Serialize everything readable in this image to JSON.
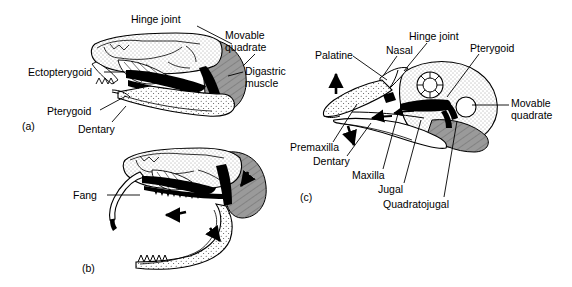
{
  "figure": {
    "background_color": "#ffffff",
    "ink_color": "#000000",
    "muscle_fill": "#9a9a9a",
    "bone_stipple": "#ffffff",
    "width": 572,
    "height": 287
  },
  "panels": [
    {
      "id": "panel-a",
      "label": "(a)",
      "subject": "snake skull, mouth closed",
      "label_x": 22,
      "label_y": 120,
      "annotations": [
        {
          "name": "hinge-joint",
          "text": "Hinge joint",
          "x": 131,
          "y": 14,
          "align": "left",
          "leader": [
            [
              197,
              26
            ],
            [
              232,
              44
            ]
          ]
        },
        {
          "name": "movable-quadrate",
          "text": "Movable\nquadrate",
          "x": 225,
          "y": 30,
          "align": "left",
          "leader": [
            [
              255,
              54
            ],
            [
              243,
              66
            ]
          ]
        },
        {
          "name": "digastric-muscle",
          "text": "Digastric\nmuscle",
          "x": 245,
          "y": 66,
          "align": "left",
          "leader": [
            [
              243,
              72
            ],
            [
              228,
              76
            ]
          ]
        },
        {
          "name": "ectopterygoid",
          "text": "Ectopterygoid",
          "x": 28,
          "y": 67,
          "align": "left",
          "leader": [
            [
              104,
              72
            ],
            [
              150,
              72
            ]
          ]
        },
        {
          "name": "pterygoid",
          "text": "Pterygoid",
          "x": 47,
          "y": 106,
          "align": "left",
          "leader": [
            [
              100,
              110
            ],
            [
              126,
              96
            ]
          ]
        },
        {
          "name": "dentary",
          "text": "Dentary",
          "x": 78,
          "y": 124,
          "align": "left",
          "leader": [
            [
              112,
              122
            ],
            [
              126,
              106
            ]
          ]
        }
      ]
    },
    {
      "id": "panel-b",
      "label": "(b)",
      "subject": "snake skull, mouth open, fang erected",
      "label_x": 82,
      "label_y": 262,
      "annotations": [
        {
          "name": "fang",
          "text": "Fang",
          "x": 73,
          "y": 190,
          "align": "left",
          "leader": [
            [
              107,
              195
            ],
            [
              140,
              195
            ]
          ]
        }
      ]
    },
    {
      "id": "panel-c",
      "label": "(c)",
      "subject": "bird skull, cranial kinesis",
      "label_x": 300,
      "label_y": 191,
      "annotations": [
        {
          "name": "hinge-joint",
          "text": "Hinge joint",
          "x": 409,
          "y": 31,
          "align": "left",
          "leader": [
            [
              427,
              43
            ],
            [
              404,
              71
            ]
          ]
        },
        {
          "name": "nasal",
          "text": "Nasal",
          "x": 386,
          "y": 45,
          "align": "left",
          "leader": [
            [
              397,
              56
            ],
            [
              383,
              76
            ]
          ]
        },
        {
          "name": "pterygoid",
          "text": "Pterygoid",
          "x": 470,
          "y": 43,
          "align": "left",
          "leader": [
            [
              479,
              54
            ],
            [
              447,
              97
            ]
          ]
        },
        {
          "name": "palatine",
          "text": "Palatine",
          "x": 315,
          "y": 50,
          "align": "left",
          "leader": [
            [
              353,
              56
            ],
            [
              387,
              80
            ]
          ]
        },
        {
          "name": "movable-quadrate",
          "text": "Movable\nquadrate",
          "x": 511,
          "y": 98,
          "align": "left",
          "leader": [
            [
              509,
              105
            ],
            [
              472,
              105
            ]
          ]
        },
        {
          "name": "premaxilla",
          "text": "Premaxilla",
          "x": 290,
          "y": 142,
          "align": "left",
          "leader": [
            [
              333,
              142
            ],
            [
              357,
              104
            ]
          ]
        },
        {
          "name": "dentary",
          "text": "Dentary",
          "x": 313,
          "y": 156,
          "align": "left",
          "leader": [
            [
              347,
              156
            ],
            [
              371,
              123
            ]
          ]
        },
        {
          "name": "maxilla",
          "text": "Maxilla",
          "x": 352,
          "y": 170,
          "align": "left",
          "leader": [
            [
              383,
              169
            ],
            [
              399,
              110
            ]
          ]
        },
        {
          "name": "jugal",
          "text": "Jugal",
          "x": 378,
          "y": 184,
          "align": "left",
          "leader": [
            [
              404,
              183
            ],
            [
              421,
              120
            ]
          ]
        },
        {
          "name": "quadratojugal",
          "text": "Quadratojugal",
          "x": 383,
          "y": 199,
          "align": "left",
          "leader": [
            [
              444,
              197
            ],
            [
              457,
              121
            ]
          ]
        }
      ]
    }
  ],
  "motion_arrows": [
    {
      "name": "arrow-panel-b-lower-jaw",
      "panel": "(b)",
      "direction": "left"
    },
    {
      "name": "arrow-panel-b-quadrate",
      "panel": "(b)",
      "direction": "down-right"
    },
    {
      "name": "arrow-panel-c-upper-bill",
      "panel": "(c)",
      "direction": "up"
    },
    {
      "name": "arrow-panel-c-lower-bill",
      "panel": "(c)",
      "direction": "down"
    },
    {
      "name": "arrow-panel-c-palatine",
      "panel": "(c)",
      "direction": "left"
    }
  ]
}
